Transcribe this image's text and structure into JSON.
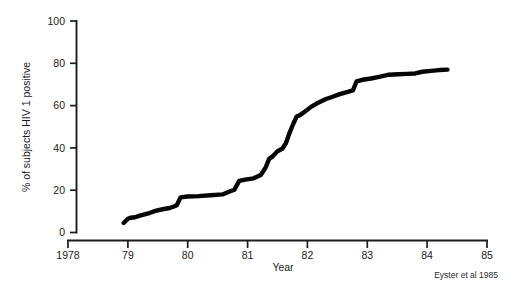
{
  "chart_data": {
    "type": "line",
    "title": "",
    "subtitle": "",
    "xlabel": "Year",
    "ylabel": "% of subjects HIV 1 positive",
    "xlim": [
      1978,
      1985
    ],
    "ylim": [
      0,
      100
    ],
    "grid": false,
    "legend": null,
    "x_ticks": [
      1978,
      1979,
      1980,
      1981,
      1982,
      1983,
      1984,
      1985
    ],
    "x_tick_labels": [
      "1978",
      "79",
      "80",
      "81",
      "82",
      "83",
      "84",
      "85"
    ],
    "y_ticks": [
      0,
      20,
      40,
      60,
      80,
      100
    ],
    "y_tick_labels": [
      "0",
      "20",
      "40",
      "60",
      "80",
      "100"
    ],
    "series": [
      {
        "name": "Cumulative % HIV 1 seropositive",
        "color": "#050505",
        "x": [
          1978.93,
          1979.0,
          1979.05,
          1979.12,
          1979.2,
          1979.28,
          1979.36,
          1979.46,
          1979.58,
          1979.7,
          1979.78,
          1979.82,
          1979.88,
          1980.0,
          1980.18,
          1980.38,
          1980.58,
          1980.7,
          1980.78,
          1980.86,
          1980.96,
          1981.1,
          1981.22,
          1981.3,
          1981.36,
          1981.42,
          1981.5,
          1981.58,
          1981.64,
          1981.7,
          1981.76,
          1981.82,
          1981.88,
          1981.96,
          1982.06,
          1982.18,
          1982.3,
          1982.42,
          1982.54,
          1982.66,
          1982.76,
          1982.82,
          1982.92,
          1983.06,
          1983.2,
          1983.36,
          1983.52,
          1983.66,
          1983.8,
          1983.92,
          1984.06,
          1984.2,
          1984.34
        ],
        "y": [
          4.5,
          6.5,
          7.0,
          7.2,
          8.0,
          8.6,
          9.2,
          10.2,
          11.0,
          11.6,
          12.4,
          13.0,
          16.6,
          17.0,
          17.2,
          17.6,
          18.0,
          19.4,
          20.2,
          24.4,
          25.0,
          25.6,
          27.2,
          30.6,
          34.8,
          36.0,
          38.4,
          39.6,
          42.2,
          47.0,
          51.2,
          54.8,
          55.6,
          57.2,
          59.4,
          61.4,
          63.0,
          64.2,
          65.4,
          66.4,
          67.2,
          71.4,
          72.2,
          72.8,
          73.6,
          74.6,
          74.8,
          75.0,
          75.2,
          76.0,
          76.4,
          76.8,
          77.0
        ]
      }
    ],
    "annotations": [
      {
        "name": "source-credit",
        "text": "Eyster et al 1985"
      }
    ]
  },
  "figure": {
    "credit": "Eyster et al 1985",
    "xlabel": "Year",
    "ylabel": "% of subjects HIV 1 positive"
  }
}
